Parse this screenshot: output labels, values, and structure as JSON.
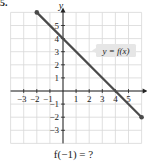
{
  "problem_number": "5.",
  "question": "f(−1) = ?",
  "label": "y = f(x)",
  "axis_x_label": "x",
  "axis_y_label": "y",
  "colors": {
    "line": "#4a4a4a",
    "grid": "#d8d8d8",
    "axis": "#222222",
    "label_bg": "#e6e6e6"
  },
  "chart_data": {
    "type": "line",
    "title": "",
    "xlabel": "x",
    "ylabel": "y",
    "xlim": [
      -4,
      6
    ],
    "ylim": [
      -4,
      6
    ],
    "grid": true,
    "x_ticks": [
      -3,
      -2,
      -1,
      1,
      2,
      3,
      4,
      5
    ],
    "y_ticks": [
      5,
      4,
      3,
      2,
      1,
      -1,
      -2,
      -3
    ],
    "series": [
      {
        "name": "y = f(x)",
        "x": [
          -2,
          6
        ],
        "y": [
          6,
          -2
        ],
        "endpoints": "closed"
      }
    ],
    "annotations": [
      "y = f(x)",
      "f(−1) = ?"
    ]
  }
}
